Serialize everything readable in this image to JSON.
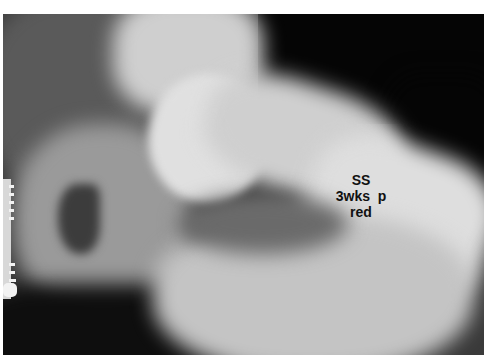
{
  "image": {
    "description": "Hip radiograph",
    "annotation": {
      "line1": "SS",
      "line2": "3wks  p",
      "line3": "red"
    }
  }
}
